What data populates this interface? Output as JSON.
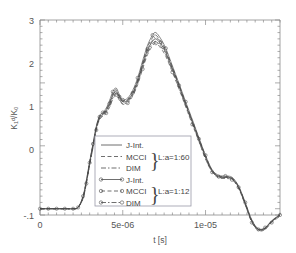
{
  "chart_data": {
    "type": "line",
    "title": "",
    "xlabel": "t [s]",
    "ylabel": "K₁ᵈ/K₀",
    "xlim": [
      0,
      1.45e-05
    ],
    "ylim": [
      -0.1,
      3
    ],
    "xticks": [
      {
        "value": 0,
        "label": "0"
      },
      {
        "value": 5e-06,
        "label": "5e-06"
      },
      {
        "value": 1e-05,
        "label": "1e-05"
      }
    ],
    "yticks": [
      {
        "value": -0.1,
        "label": "-.1"
      },
      {
        "value": 0,
        "label": "0"
      },
      {
        "value": 1,
        "label": "1"
      },
      {
        "value": 2,
        "label": "2"
      },
      {
        "value": 3,
        "label": "3"
      }
    ],
    "grid": false,
    "legend_position": "lower-center",
    "x": [
      0,
      5e-07,
      1e-06,
      1.5e-06,
      2e-06,
      2.3e-06,
      2.6e-06,
      2.8e-06,
      3e-06,
      3.2e-06,
      3.4e-06,
      3.6e-06,
      3.8e-06,
      4e-06,
      4.2e-06,
      4.4e-06,
      4.6e-06,
      4.8e-06,
      5e-06,
      5.3e-06,
      5.6e-06,
      5.9e-06,
      6.2e-06,
      6.5e-06,
      6.8e-06,
      7e-06,
      7.3e-06,
      7.6e-06,
      8e-06,
      8.4e-06,
      8.8e-06,
      9.2e-06,
      9.6e-06,
      1e-05,
      1.04e-05,
      1.08e-05,
      1.12e-05,
      1.16e-05,
      1.2e-05,
      1.24e-05,
      1.28e-05,
      1.32e-05,
      1.36e-05,
      1.4e-05,
      1.45e-05
    ],
    "series": [
      {
        "name": "J-Int.",
        "group": "L:a=1:60",
        "style": "solid",
        "marker": "none",
        "values": [
          0,
          0,
          0,
          0,
          0,
          0.02,
          0.18,
          0.42,
          0.72,
          1.0,
          1.28,
          1.45,
          1.5,
          1.56,
          1.66,
          1.8,
          1.86,
          1.77,
          1.7,
          1.72,
          1.83,
          2.02,
          2.28,
          2.52,
          2.66,
          2.7,
          2.62,
          2.48,
          2.22,
          1.95,
          1.66,
          1.38,
          1.1,
          0.82,
          0.6,
          0.51,
          0.5,
          0.48,
          0.34,
          0.08,
          -0.2,
          -0.33,
          -0.31,
          -0.2,
          -0.1
        ]
      },
      {
        "name": "MCCI",
        "group": "L:a=1:60",
        "style": "dashed",
        "marker": "none",
        "values": [
          0,
          0,
          0,
          0,
          0,
          0.02,
          0.19,
          0.44,
          0.74,
          1.02,
          1.3,
          1.47,
          1.52,
          1.58,
          1.69,
          1.83,
          1.89,
          1.79,
          1.72,
          1.74,
          1.86,
          2.05,
          2.32,
          2.57,
          2.72,
          2.76,
          2.66,
          2.52,
          2.25,
          1.97,
          1.68,
          1.4,
          1.12,
          0.84,
          0.61,
          0.52,
          0.51,
          0.49,
          0.35,
          0.09,
          -0.19,
          -0.33,
          -0.31,
          -0.2,
          -0.1
        ]
      },
      {
        "name": "DIM",
        "group": "L:a=1:60",
        "style": "dashdot",
        "marker": "none",
        "values": [
          0,
          0,
          0,
          0,
          0,
          0.02,
          0.17,
          0.41,
          0.7,
          0.98,
          1.26,
          1.43,
          1.48,
          1.54,
          1.63,
          1.76,
          1.83,
          1.74,
          1.67,
          1.7,
          1.81,
          1.99,
          2.25,
          2.48,
          2.62,
          2.66,
          2.58,
          2.45,
          2.19,
          1.92,
          1.64,
          1.36,
          1.08,
          0.8,
          0.59,
          0.5,
          0.49,
          0.47,
          0.33,
          0.07,
          -0.21,
          -0.34,
          -0.32,
          -0.21,
          -0.11
        ]
      },
      {
        "name": "J-Int.",
        "group": "L:a=1:12",
        "style": "solid",
        "marker": "circle",
        "values": [
          0,
          0,
          0,
          0,
          0,
          0.02,
          0.2,
          0.45,
          0.75,
          1.03,
          1.31,
          1.48,
          1.53,
          1.6,
          1.72,
          1.86,
          1.92,
          1.81,
          1.73,
          1.76,
          1.88,
          2.08,
          2.35,
          2.6,
          2.76,
          2.8,
          2.7,
          2.55,
          2.27,
          1.99,
          1.7,
          1.42,
          1.13,
          0.85,
          0.62,
          0.53,
          0.52,
          0.5,
          0.36,
          0.1,
          -0.18,
          -0.32,
          -0.3,
          -0.19,
          -0.09
        ]
      },
      {
        "name": "MCCI",
        "group": "L:a=1:12",
        "style": "dashed",
        "marker": "circle",
        "values": [
          0,
          0,
          0,
          0,
          0,
          0.02,
          0.16,
          0.4,
          0.69,
          0.97,
          1.25,
          1.42,
          1.47,
          1.52,
          1.61,
          1.74,
          1.81,
          1.72,
          1.66,
          1.68,
          1.79,
          1.97,
          2.22,
          2.45,
          2.59,
          2.63,
          2.55,
          2.42,
          2.17,
          1.9,
          1.62,
          1.34,
          1.07,
          0.79,
          0.58,
          0.49,
          0.48,
          0.46,
          0.32,
          0.06,
          -0.22,
          -0.35,
          -0.33,
          -0.22,
          -0.12
        ]
      },
      {
        "name": "DIM",
        "group": "L:a=1:12",
        "style": "dashdot",
        "marker": "circle",
        "values": [
          0,
          0,
          0,
          0,
          0,
          0.02,
          0.18,
          0.43,
          0.73,
          1.01,
          1.29,
          1.46,
          1.51,
          1.57,
          1.67,
          1.81,
          1.87,
          1.78,
          1.71,
          1.73,
          1.84,
          2.03,
          2.3,
          2.54,
          2.68,
          2.73,
          2.64,
          2.5,
          2.23,
          1.96,
          1.67,
          1.39,
          1.11,
          0.83,
          0.6,
          0.51,
          0.5,
          0.48,
          0.34,
          0.08,
          -0.2,
          -0.33,
          -0.31,
          -0.2,
          -0.1
        ]
      }
    ]
  },
  "legend": {
    "entries": [
      {
        "label": "J-Int."
      },
      {
        "label": "MCCI"
      },
      {
        "label": "DIM"
      },
      {
        "label": "J-Int."
      },
      {
        "label": "MCCI"
      },
      {
        "label": "DIM"
      }
    ],
    "groups": [
      {
        "label": "L:a=1:60"
      },
      {
        "label": "L:a=1:12"
      }
    ]
  },
  "axes": {
    "x_title": "t [s]",
    "y_title": "K₁ᵈ/K₀",
    "x_tick_labels": [
      "0",
      "5e-06",
      "1e-05"
    ],
    "y_tick_labels": [
      "3",
      "2",
      "1",
      "0",
      "-.1"
    ]
  },
  "colors": {
    "background": "#ffffff",
    "axis": "#8a8a8a",
    "curve": "#4a4a4a",
    "text": "#555555",
    "legend_border": "#9a9aa8"
  }
}
